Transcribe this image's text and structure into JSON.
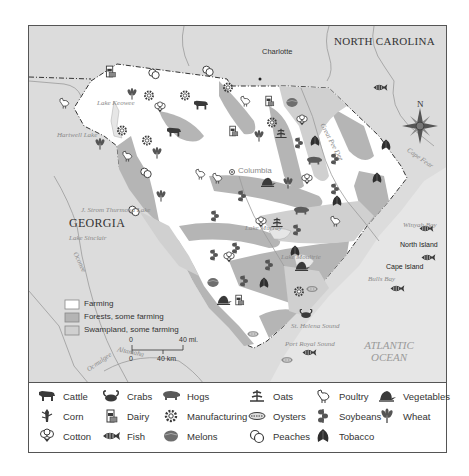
{
  "map": {
    "states": {
      "north_carolina": "NORTH CAROLINA",
      "georgia": "GEORGIA"
    },
    "cities": {
      "charlotte": "Charlotte",
      "columbia": "Columbia",
      "north_island": "North Island",
      "cape_island": "Cape Island"
    },
    "water_labels": {
      "lake_keowee": "Lake Keowee",
      "hartwell_lake": "Hartwell Lake",
      "thurmond_lake": "J. Strom Thurmond Lake",
      "lake_sinclair": "Lake Sinclair",
      "lake_murray": "Lake Murray",
      "lake_moultrie": "Lake Moultrie",
      "winyah_bay": "Winyah Bay",
      "bulls_bay": "Bulls Bay",
      "st_helena_sound": "St. Helena Sound",
      "port_royal_sound": "Port Royal Sound",
      "cape_fear": "Cape Fear",
      "oconee": "Oconee",
      "ocmulgee": "Ocmulgee",
      "altamaha": "Altamaha",
      "great_pee_dee": "Great Pee Dee",
      "atlantic_ocean_1": "ATLANTIC",
      "atlantic_ocean_2": "OCEAN"
    },
    "compass": {
      "north_label": "N"
    },
    "scale_bar": {
      "mi_start": "0",
      "mi_end": "40 mi.",
      "km_start": "0",
      "km_end": "40 km"
    },
    "land_use_key": [
      {
        "label": "Farming",
        "color": "#ffffff"
      },
      {
        "label": "Forests, some farming",
        "color": "#b4b4b4"
      },
      {
        "label": "Swampland, some farming",
        "color": "#d0d0d0"
      }
    ],
    "colors": {
      "outside_land": "#dcdcdc",
      "farming": "#ffffff",
      "forest": "#b5b5b5",
      "swamp": "#cfcfcf",
      "ocean": "#e4e4e4",
      "border": "#333333",
      "icon": "#3a3a3a"
    }
  },
  "legend": {
    "items": [
      {
        "icon": "cattle-icon",
        "label": "Cattle"
      },
      {
        "icon": "corn-icon",
        "label": "Corn"
      },
      {
        "icon": "cotton-icon",
        "label": "Cotton"
      },
      {
        "icon": "crabs-icon",
        "label": "Crabs"
      },
      {
        "icon": "dairy-icon",
        "label": "Dairy"
      },
      {
        "icon": "fish-icon",
        "label": "Fish"
      },
      {
        "icon": "hogs-icon",
        "label": "Hogs"
      },
      {
        "icon": "manufacturing-icon",
        "label": "Manufacturing"
      },
      {
        "icon": "melons-icon",
        "label": "Melons"
      },
      {
        "icon": "oats-icon",
        "label": "Oats"
      },
      {
        "icon": "oysters-icon",
        "label": "Oysters"
      },
      {
        "icon": "peaches-icon",
        "label": "Peaches"
      },
      {
        "icon": "poultry-icon",
        "label": "Poultry"
      },
      {
        "icon": "soybeans-icon",
        "label": "Soybeans"
      },
      {
        "icon": "tobacco-icon",
        "label": "Tobacco"
      },
      {
        "icon": "vegetables-icon",
        "label": "Vegetables"
      },
      {
        "icon": "wheat-icon",
        "label": "Wheat"
      }
    ]
  }
}
